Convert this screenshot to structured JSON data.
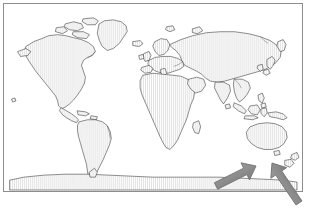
{
  "figure": {
    "kind": "world-map-figure",
    "title": "World map with arrows indicating New Zealand",
    "projection": "equirectangular",
    "background_color": "#ffffff",
    "frame": {
      "visible": true,
      "color": "#8d8d8d",
      "line_width_px": 1,
      "inset_px": 3,
      "width_px": 300,
      "height_px": 189
    },
    "land": {
      "outline_color": "#1a1a1a",
      "outline_width_px": 0.5,
      "fill_style": "vertical-hatch",
      "fill_color": "#ffffff",
      "hatch_color": "#c9c9c9",
      "hatch_spacing_px": 2
    },
    "ocean": {
      "fill_color": "#ffffff"
    },
    "annotations": [
      {
        "name": "arrow-left",
        "shape": "arrow",
        "color": "#8c8c8c",
        "outline_color": "#6f6f6f",
        "direction": "northeast",
        "points_to": "New Zealand",
        "tail_x": 216,
        "tail_y": 186,
        "tip_x": 256,
        "tip_y": 166
      },
      {
        "name": "arrow-right",
        "shape": "arrow",
        "color": "#8c8c8c",
        "outline_color": "#6f6f6f",
        "direction": "northwest",
        "points_to": "New Zealand",
        "tail_x": 299,
        "tail_y": 203,
        "tip_x": 272,
        "tip_y": 163
      }
    ],
    "regions_visible": [
      "North America",
      "Greenland",
      "South America",
      "Europe",
      "Africa",
      "Asia",
      "Australia",
      "New Zealand",
      "Antarctica",
      "Japan",
      "Indonesia",
      "Philippines",
      "Madagascar",
      "Iceland",
      "United Kingdom",
      "Sri Lanka",
      "New Guinea"
    ],
    "labels": [],
    "legend": null
  }
}
